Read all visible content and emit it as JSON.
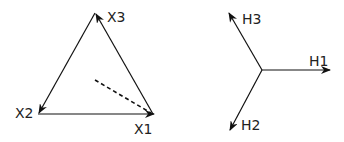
{
  "left_diagram": {
    "labels": {
      "x1": "X1",
      "x2": "X2",
      "x3": "X3"
    },
    "stroke_color": "#111111"
  },
  "right_diagram": {
    "labels": {
      "h1": "H1",
      "h2": "H2",
      "h3": "H3"
    },
    "stroke_color": "#111111"
  }
}
